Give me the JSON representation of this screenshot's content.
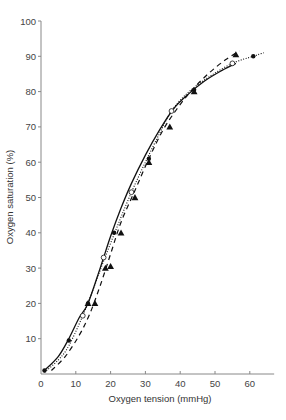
{
  "chart_data": {
    "type": "line",
    "title": "",
    "xlabel": "Oxygen tension (mmHg)",
    "ylabel": "Oxygen saturation (%)",
    "xlim": [
      0,
      67
    ],
    "ylim": [
      0,
      100
    ],
    "xticks": [
      0,
      10,
      20,
      30,
      40,
      50,
      60
    ],
    "yticks": [
      10,
      20,
      30,
      40,
      50,
      60,
      70,
      80,
      90,
      100
    ],
    "grid": false,
    "legend": "none",
    "series": [
      {
        "name": "solid curve (filled circles)",
        "style": "solid",
        "marker": "filled-circle",
        "curve": [
          [
            1,
            1
          ],
          [
            5,
            5
          ],
          [
            8,
            10
          ],
          [
            11,
            16
          ],
          [
            13.5,
            20
          ],
          [
            17,
            30
          ],
          [
            20,
            39
          ],
          [
            23,
            47
          ],
          [
            26,
            54
          ],
          [
            30,
            62
          ],
          [
            34,
            69
          ],
          [
            38,
            75
          ],
          [
            42,
            79
          ],
          [
            47,
            83
          ],
          [
            52,
            86
          ],
          [
            56,
            88
          ]
        ],
        "points": [
          [
            1,
            1
          ],
          [
            8,
            9.5
          ],
          [
            13.5,
            20
          ],
          [
            21,
            40
          ],
          [
            31,
            61
          ],
          [
            44,
            80.5
          ],
          [
            61,
            90
          ]
        ]
      },
      {
        "name": "dotted curve (open circles)",
        "style": "dotted",
        "marker": "open-circle",
        "curve": [
          [
            1,
            0.5
          ],
          [
            5,
            4
          ],
          [
            8,
            8
          ],
          [
            12,
            16.5
          ],
          [
            15,
            24
          ],
          [
            18,
            32
          ],
          [
            22,
            42
          ],
          [
            26,
            51.5
          ],
          [
            30,
            60
          ],
          [
            34,
            68
          ],
          [
            37.5,
            74.5
          ],
          [
            42,
            79.5
          ],
          [
            48,
            84
          ],
          [
            55,
            88
          ],
          [
            61,
            90
          ],
          [
            64,
            91
          ]
        ],
        "points": [
          [
            12,
            16.5
          ],
          [
            18,
            33
          ],
          [
            26,
            51.5
          ],
          [
            37.5,
            74.5
          ],
          [
            55,
            88
          ]
        ]
      },
      {
        "name": "dashed curve (filled triangles)",
        "style": "dashed",
        "marker": "filled-triangle",
        "curve": [
          [
            3,
            1
          ],
          [
            7,
            5
          ],
          [
            11,
            11
          ],
          [
            14,
            17
          ],
          [
            17,
            25
          ],
          [
            20,
            34
          ],
          [
            23,
            43
          ],
          [
            27,
            52
          ],
          [
            31,
            61
          ],
          [
            35,
            69
          ],
          [
            39,
            75
          ],
          [
            43,
            80
          ],
          [
            48,
            85
          ],
          [
            53,
            89
          ],
          [
            57,
            91.5
          ]
        ],
        "points": [
          [
            13.5,
            20
          ],
          [
            15.5,
            20
          ],
          [
            18.5,
            30
          ],
          [
            20,
            30.5
          ],
          [
            23,
            40
          ],
          [
            27,
            50
          ],
          [
            31,
            60
          ],
          [
            37,
            70
          ],
          [
            44,
            80
          ],
          [
            56,
            90.5
          ]
        ]
      }
    ]
  }
}
